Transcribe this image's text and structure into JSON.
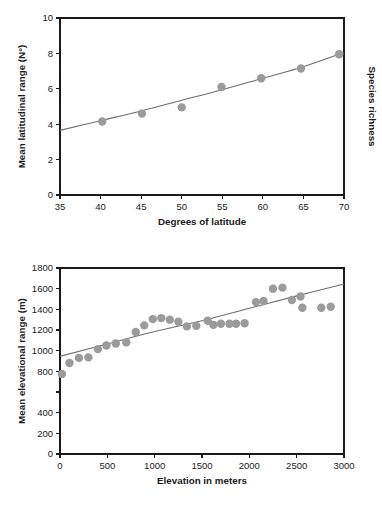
{
  "figure": {
    "background": "#ffffff",
    "point_color": "#9b9b9b",
    "line_color": "#6e6e6e",
    "axis_color": "#1a1a1a"
  },
  "chart_data": [
    {
      "type": "scatter",
      "id": "latitude-panel",
      "title": "",
      "xlabel": "Degrees of latitude",
      "ylabel": "Mean latitudinal range (N°)",
      "right_label": "Species richness",
      "xlim": [
        35,
        70
      ],
      "ylim": [
        0,
        10
      ],
      "xticks": [
        35,
        40,
        45,
        50,
        55,
        60,
        65,
        70
      ],
      "xtick_labels": [
        "35",
        "40",
        "45",
        "50",
        "55",
        "60",
        "65",
        "70"
      ],
      "yticks": [
        0,
        2,
        4,
        6,
        8,
        10
      ],
      "ytick_labels": [
        "0",
        "2",
        "4",
        "6",
        "8",
        "10"
      ],
      "grid": false,
      "legend": "none",
      "x": [
        40.2,
        45.1,
        50.0,
        54.9,
        59.8,
        64.7,
        69.4
      ],
      "y": [
        4.15,
        4.6,
        4.95,
        6.1,
        6.6,
        7.15,
        7.95
      ],
      "trend": {
        "kind": "curve",
        "x": [
          35,
          40,
          45,
          50,
          55,
          60,
          65,
          70
        ],
        "y": [
          3.65,
          4.2,
          4.75,
          5.35,
          5.95,
          6.6,
          7.25,
          8.05
        ]
      }
    },
    {
      "type": "scatter",
      "id": "elevation-panel",
      "title": "",
      "xlabel": "Elevation in meters",
      "ylabel": "Mean elevational range (m)",
      "right_label": "",
      "xlim": [
        0,
        3000
      ],
      "ylim": [
        0,
        1800
      ],
      "xticks": [
        0,
        500,
        1000,
        1500,
        2000,
        2500,
        3000
      ],
      "xtick_labels": [
        "0",
        "500",
        "1000",
        "1500",
        "2000",
        "2500",
        "3000"
      ],
      "yticks": [
        0,
        200,
        400,
        600,
        800,
        1000,
        1200,
        1400,
        1600,
        1800
      ],
      "ytick_labels": [
        "0",
        "200",
        "400",
        "",
        "800",
        "1000",
        "1200",
        "1400",
        "1600",
        "1800"
      ],
      "grid": false,
      "legend": "none",
      "x": [
        20,
        100,
        200,
        300,
        400,
        490,
        590,
        700,
        800,
        890,
        980,
        1070,
        1160,
        1250,
        1340,
        1440,
        1560,
        1620,
        1700,
        1790,
        1860,
        1950,
        2070,
        2150,
        2250,
        2350,
        2450,
        2540,
        2560,
        2760,
        2860
      ],
      "y": [
        775,
        880,
        930,
        935,
        1015,
        1050,
        1070,
        1080,
        1180,
        1245,
        1305,
        1315,
        1300,
        1280,
        1235,
        1240,
        1290,
        1250,
        1260,
        1260,
        1260,
        1265,
        1470,
        1480,
        1600,
        1610,
        1490,
        1525,
        1415,
        1415,
        1425
      ],
      "trend": {
        "kind": "curve",
        "x": [
          0,
          500,
          1000,
          1500,
          2000,
          2500,
          3000
        ],
        "y": [
          945,
          1065,
          1185,
          1290,
          1410,
          1530,
          1645
        ]
      }
    }
  ]
}
